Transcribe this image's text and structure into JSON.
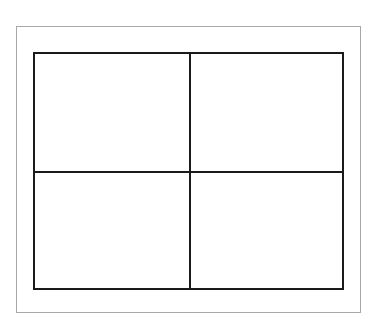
{
  "diagram": {
    "type": "grid",
    "rows": 2,
    "columns": 2,
    "cells": [
      {
        "row": 0,
        "col": 0,
        "label": ""
      },
      {
        "row": 0,
        "col": 1,
        "label": ""
      },
      {
        "row": 1,
        "col": 0,
        "label": ""
      },
      {
        "row": 1,
        "col": 1,
        "label": ""
      }
    ],
    "colors": {
      "frame_border": "#a8a8a8",
      "grid_lines": "#1a1a1a",
      "background": "#ffffff"
    }
  }
}
